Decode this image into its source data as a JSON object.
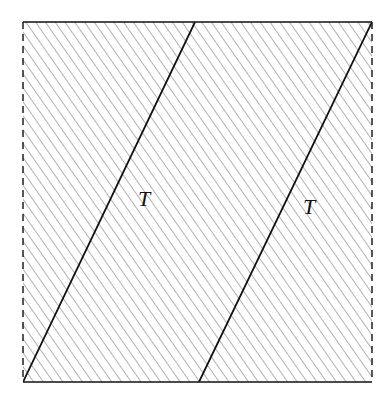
{
  "diagram": {
    "type": "hatched square with two parallel slanted lines (torus fundamental domain)",
    "square": {
      "x": 23,
      "y": 22,
      "width": 349,
      "height": 360
    },
    "edges": {
      "top": "solid",
      "bottom": "solid",
      "left": "dashed",
      "right": "dashed"
    },
    "hatch": {
      "angle_deg": 35,
      "spacing": 8,
      "color": "#555555"
    },
    "lines": [
      {
        "x1": 195,
        "y1": 22,
        "x2": 23,
        "y2": 382
      },
      {
        "x1": 372,
        "y1": 22,
        "x2": 199,
        "y2": 382
      }
    ],
    "labels": [
      {
        "text": "T",
        "x": 138,
        "y": 206
      },
      {
        "text": "T",
        "x": 303,
        "y": 214
      }
    ],
    "line_color": "#111111"
  }
}
